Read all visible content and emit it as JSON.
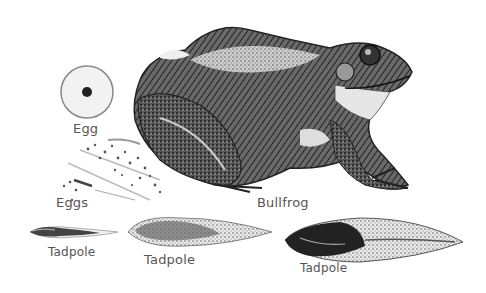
{
  "illustration": {
    "subject": "Frog life cycle",
    "labels": {
      "egg": "Egg",
      "eggs": "Eggs",
      "bullfrog": "Bullfrog",
      "tadpole_1": "Tadpole",
      "tadpole_2": "Tadpole",
      "tadpole_3": "Tadpole"
    },
    "colors": {
      "ink": "#2a2a2a",
      "mid": "#777777",
      "light": "#d8d8d8",
      "background": "#ffffff"
    }
  }
}
